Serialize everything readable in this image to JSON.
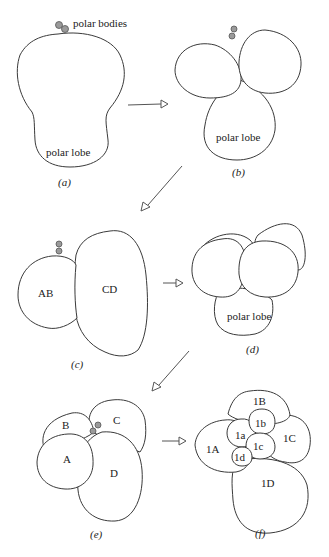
{
  "figure": {
    "panels": [
      {
        "id": "a",
        "caption": "(a)",
        "labels": {
          "polar_bodies": "polar bodies",
          "polar_lobe": "polar lobe"
        }
      },
      {
        "id": "b",
        "caption": "(b)",
        "labels": {
          "polar_lobe": "polar lobe"
        }
      },
      {
        "id": "c",
        "caption": "(c)",
        "labels": {
          "ab": "AB",
          "cd": "CD"
        }
      },
      {
        "id": "d",
        "caption": "(d)",
        "labels": {
          "polar_lobe": "polar lobe"
        }
      },
      {
        "id": "e",
        "caption": "(e)",
        "labels": {
          "a": "A",
          "b": "B",
          "c": "C",
          "d": "D"
        }
      },
      {
        "id": "f",
        "caption": "(f)",
        "labels": {
          "1A": "1A",
          "1B": "1B",
          "1C": "1C",
          "1D": "1D",
          "1a": "1a",
          "1b": "1b",
          "1c": "1c",
          "1d": "1d"
        }
      }
    ],
    "sequence": [
      "a",
      "b",
      "c",
      "d",
      "e",
      "f"
    ],
    "colors": {
      "outline": "#3a3a3a",
      "polar_body": "#9a9a9a",
      "arrow": "#555555"
    }
  }
}
